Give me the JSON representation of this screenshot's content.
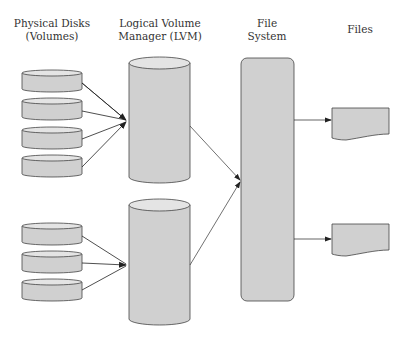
{
  "labels": {
    "physical_disks": "Physical Disks (Volumes)",
    "physical_disks_line1": "Physical Disks",
    "physical_disks_line2": "(Volumes)",
    "lvm_line1": "Logical Volume",
    "lvm_line2": "Manager (LVM)",
    "fs_line1": "File",
    "fs_line2": "System",
    "files": "Files"
  },
  "colors": {
    "fill": "#d0d0d0",
    "top": "#e4e4e4",
    "stroke": "#444444",
    "arrow": "#222222"
  },
  "groups": [
    {
      "name": "group-1",
      "disk_count": 4,
      "logical_volume": "logical-volume-1"
    },
    {
      "name": "group-2",
      "disk_count": 3,
      "logical_volume": "logical-volume-2"
    }
  ],
  "files_count": 2
}
